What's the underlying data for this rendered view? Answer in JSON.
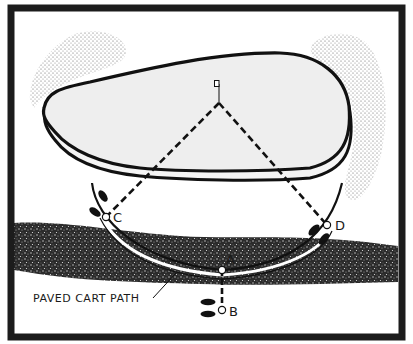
{
  "diagram": {
    "title": "",
    "colors": {
      "background": "#ffffff",
      "frame": "#1c1c1c",
      "green_fill": "#efefef",
      "outline": "#111111",
      "rough": "#2a2a2a",
      "bunker_stipple": "#6a6a6a",
      "dash": "#111111"
    },
    "frame": {
      "x": 11,
      "y": 8,
      "width": 391,
      "height": 329,
      "stroke_width": 7
    },
    "flag": {
      "x": 219,
      "y": 84,
      "label": ""
    },
    "points": [
      {
        "id": "A",
        "label": "A",
        "x": 222,
        "y": 270
      },
      {
        "id": "B",
        "label": "B",
        "x": 222,
        "y": 310
      },
      {
        "id": "C",
        "label": "C",
        "x": 106,
        "y": 217
      },
      {
        "id": "D",
        "label": "D",
        "x": 327,
        "y": 225
      }
    ],
    "lines": [
      {
        "from": "flag",
        "to": "C",
        "style": "dashed"
      },
      {
        "from": "flag",
        "to": "D",
        "style": "dashed"
      },
      {
        "from": "A",
        "to": "B",
        "style": "dashed"
      }
    ],
    "annotations": [
      {
        "text": "PAVED CART PATH",
        "x": 33,
        "y": 302,
        "pointer_to": {
          "x": 176,
          "y": 273
        }
      }
    ],
    "features": [
      {
        "name": "putting-green",
        "type": "green"
      },
      {
        "name": "bunker-left",
        "type": "bunker"
      },
      {
        "name": "bunker-right",
        "type": "bunker"
      },
      {
        "name": "rough-band",
        "type": "rough"
      },
      {
        "name": "cart-path",
        "type": "path"
      },
      {
        "name": "footprints-c",
        "type": "footprints"
      },
      {
        "name": "footprints-d",
        "type": "footprints"
      },
      {
        "name": "footprints-b",
        "type": "footprints"
      }
    ]
  }
}
